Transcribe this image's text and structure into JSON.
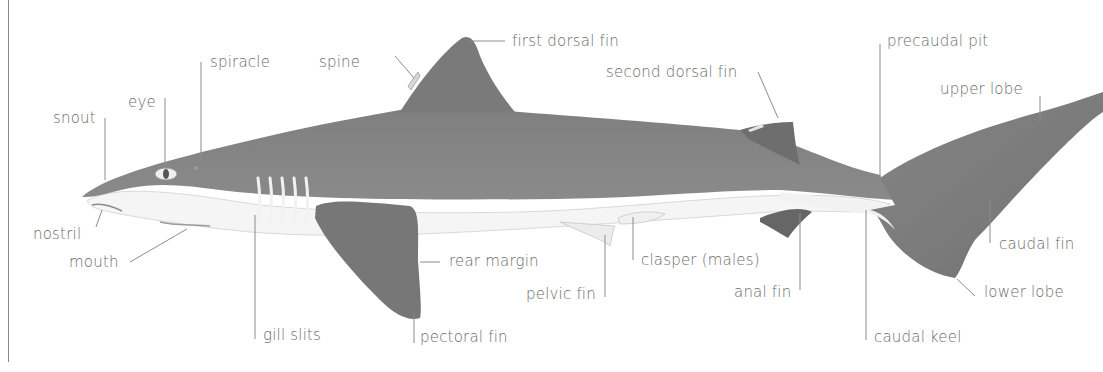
{
  "diagram": {
    "colors": {
      "body_dark": "#7d7d7d",
      "fin_dark": "#6f6f6f",
      "belly": "#f4f4f4",
      "leader_line": "#8c8c8c",
      "label_text": "#6b6b6b"
    },
    "labels": {
      "snout": "snout",
      "eye": "eye",
      "spiracle": "spiracle",
      "spine": "spine",
      "first_dorsal_fin": "first dorsal fin",
      "second_dorsal_fin": "second dorsal fin",
      "precaudal_pit": "precaudal pit",
      "upper_lobe": "upper lobe",
      "nostril": "nostril",
      "mouth": "mouth",
      "gill_slits": "gill slits",
      "pectoral_fin": "pectoral fin",
      "rear_margin": "rear margin",
      "pelvic_fin": "pelvic fin",
      "clasper": "clasper (males)",
      "anal_fin": "anal fin",
      "caudal_keel": "caudal keel",
      "caudal_fin": "caudal fin",
      "lower_lobe": "lower lobe"
    }
  }
}
